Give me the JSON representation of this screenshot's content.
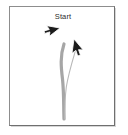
{
  "panel": {
    "title": "Start",
    "background_color": "#ffffff",
    "border_color": "#7a7a7a",
    "shadow_color": "#d6d6d6",
    "width": 106,
    "height": 120
  },
  "cursors": [
    {
      "name": "pointer-right",
      "label": "Start",
      "direction": "right",
      "x": 66,
      "y": 32,
      "color": "#1c1c1c"
    },
    {
      "name": "pointer-up-left",
      "label": "",
      "direction": "up-left",
      "x": 77,
      "y": 45,
      "color": "#1c1c1c"
    }
  ],
  "strokes": [
    {
      "name": "thick-stroke",
      "color": "#a6a6a6",
      "width": 3.2,
      "points": "M 63.5,43 C 59.5,55 60.5,66 62.0,78 C 63.5,92 63.0,105 63.5,118"
    },
    {
      "name": "thin-stroke",
      "color": "#b8b8b8",
      "width": 1.1,
      "points": "M 76.0,46 C 72.5,58 68.0,72 65.8,86 C 64.4,97 64.2,108 64.2,118"
    }
  ],
  "labels": {
    "title_color": "#2b2b2b",
    "title_size_px": 7.5
  }
}
